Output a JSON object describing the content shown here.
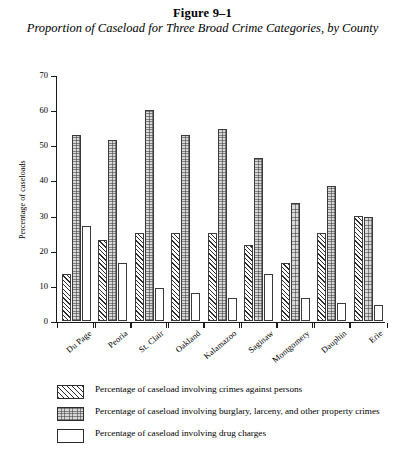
{
  "figure": {
    "number": "Figure 9–1",
    "title": "Proportion of Caseload for Three Broad Crime Categories, by County"
  },
  "chart_data": {
    "type": "bar",
    "title": "Proportion of Caseload for Three Broad Crime Categories, by County",
    "xlabel": "",
    "ylabel": "Percentage of caseloads",
    "ylim": [
      0,
      70
    ],
    "yticks": [
      0,
      10,
      20,
      30,
      40,
      50,
      60,
      70
    ],
    "grid": false,
    "legend_position": "below",
    "categories": [
      "Du Page",
      "Peoria",
      "St. Clair",
      "Oakland",
      "Kalamazoo",
      "Saginaw",
      "Montgomery",
      "Dauphin",
      "Erie"
    ],
    "series": [
      {
        "name": "Percentage of caseload involving crimes against persons",
        "pattern": "diagonal-hatch",
        "values": [
          13.5,
          23,
          25,
          25,
          25,
          21.5,
          16.5,
          25,
          30
        ]
      },
      {
        "name": "Percentage of caseload involving burglary, larceny, and other property crimes",
        "pattern": "stipple",
        "values": [
          53,
          51.5,
          60,
          53,
          54.5,
          46.5,
          33.5,
          38.5,
          29.5
        ]
      },
      {
        "name": "Percentage of caseload involving drug charges",
        "pattern": "white",
        "values": [
          27,
          16.5,
          9.5,
          8,
          6.5,
          13.5,
          6.5,
          5,
          4.5
        ]
      }
    ]
  },
  "legend": {
    "items": [
      {
        "label": "Percentage of caseload involving crimes against persons"
      },
      {
        "label": "Percentage of caseload involving burglary, larceny, and other property crimes"
      },
      {
        "label": "Percentage of caseload involving drug charges"
      }
    ]
  }
}
